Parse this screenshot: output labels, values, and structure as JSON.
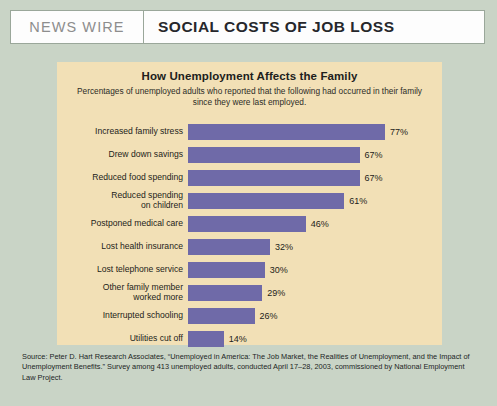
{
  "header": {
    "kicker": "NEWS WIRE",
    "headline": "SOCIAL COSTS OF JOB LOSS"
  },
  "chart_data": {
    "type": "bar",
    "orientation": "horizontal",
    "title": "How Unemployment Affects the Family",
    "subtitle": "Percentages of unemployed adults who reported that the following had occurred in their family since they were last employed.",
    "xlabel": "",
    "ylabel": "",
    "xlim": [
      0,
      100
    ],
    "grid": false,
    "legend": "none",
    "unit": "%",
    "bar_color": "#6f6aa8",
    "panel_color": "#f2e0b6",
    "page_color": "#c9d4c6",
    "categories": [
      "Increased family stress",
      "Drew down savings",
      "Reduced food spending",
      "Reduced spending\non children",
      "Postponed medical care",
      "Lost health insurance",
      "Lost telephone service",
      "Other family member\nworked more",
      "Interrupted schooling",
      "Utilities cut off"
    ],
    "values": [
      77,
      67,
      67,
      61,
      46,
      32,
      30,
      29,
      26,
      14
    ],
    "value_labels": [
      "77%",
      "67%",
      "67%",
      "61%",
      "46%",
      "32%",
      "30%",
      "29%",
      "26%",
      "14%"
    ]
  },
  "source": {
    "text": "Source: Peter D. Hart Research Associates, “Unemployed in America: The Job Market, the Realities of Unemployment, and the Impact of Unemployment Benefits.” Survey among 413 unemployed adults, conducted April 17–28, 2003, commissioned by National Employment Law Project."
  }
}
